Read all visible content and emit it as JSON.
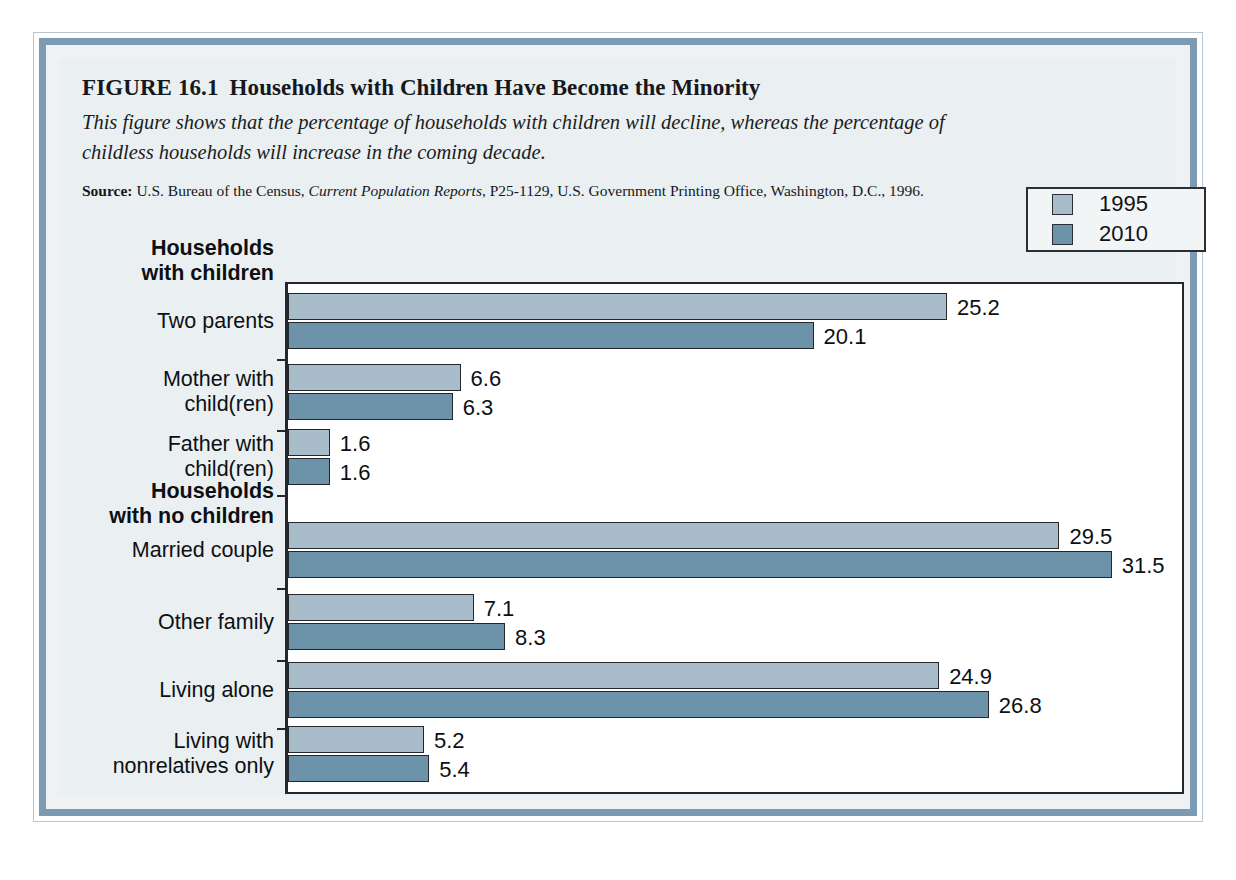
{
  "figure": {
    "number": "FIGURE 16.1",
    "title": "Households with Children Have Become the Minority",
    "caption": "This figure shows that the percentage of households with children will decline, whereas the percentage of childless households will increase in the coming decade.",
    "source_label": "Source:",
    "source_text_1": "U.S. Bureau of the Census,",
    "source_italic": "Current Population Reports",
    "source_text_2": ", P25-1129, U.S. Government Printing Office, Washington, D.C., 1996."
  },
  "legend": {
    "entries": [
      {
        "label": "1995",
        "color": "#a8bcca"
      },
      {
        "label": "2010",
        "color": "#6d93ab"
      }
    ]
  },
  "group_headings": [
    {
      "id": "with-children",
      "text": "Households\nwith children"
    },
    {
      "id": "no-children",
      "text": "Households\nwith no children"
    }
  ],
  "chart_data": {
    "type": "bar",
    "orientation": "horizontal",
    "title": "Households with Children Have Become the Minority",
    "subtitle": "This figure shows that the percentage of households with children will decline, whereas the percentage of childless households will increase in the coming decade.",
    "xlabel": "",
    "ylabel": "",
    "xlim": [
      0,
      34
    ],
    "grid": false,
    "legend_position": "top-right",
    "value_labels": true,
    "categories": [
      "Two parents",
      "Mother with\nchild(ren)",
      "Father with\nchild(ren)",
      "Married couple",
      "Other family",
      "Living alone",
      "Living with\nnonrelatives only"
    ],
    "group_of_category": [
      "Households with children",
      "Households with children",
      "Households with children",
      "Households with no children",
      "Households with no children",
      "Households with no children",
      "Households with no children"
    ],
    "series": [
      {
        "name": "1995",
        "color": "#a8bcca",
        "values": [
          25.2,
          6.6,
          1.6,
          29.5,
          7.1,
          24.9,
          5.2
        ]
      },
      {
        "name": "2010",
        "color": "#6d93ab",
        "values": [
          20.1,
          6.3,
          1.6,
          31.5,
          8.3,
          26.8,
          5.4
        ]
      }
    ]
  }
}
